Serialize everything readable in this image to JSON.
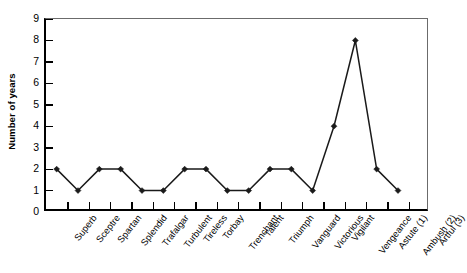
{
  "chart_data": {
    "type": "line",
    "title": "",
    "xlabel": "",
    "ylabel": "Number of years",
    "ylim": [
      0,
      9
    ],
    "ytick_step": 1,
    "yticks": [
      0,
      1,
      2,
      3,
      4,
      5,
      6,
      7,
      8,
      9
    ],
    "ytick_labels": [
      "0",
      "1",
      "2",
      "3",
      "4",
      "5",
      "6",
      "7",
      "8",
      "9"
    ],
    "grid": false,
    "legend": null,
    "marker": "diamond",
    "line_color": "#1a1a1a",
    "categories": [
      "Superb",
      "Sceptre",
      "Spartan",
      "Splendid",
      "Trafalgar",
      "Turbulent",
      "Tireless",
      "Torbay",
      "Trenchant",
      "Talent",
      "Triumph",
      "Vanguard",
      "Victorious",
      "Vigilant",
      "Vengeance",
      "Astute (1)",
      "Ambush (2)",
      "Artful (3)"
    ],
    "values": [
      2,
      1,
      2,
      2,
      1,
      1,
      2,
      2,
      1,
      1,
      2,
      2,
      1,
      4,
      8,
      2,
      1,
      null
    ],
    "series": [
      {
        "name": "Number of years",
        "points": [
          {
            "category": "Superb",
            "value": 2
          },
          {
            "category": "Sceptre",
            "value": 1
          },
          {
            "category": "Spartan",
            "value": 2
          },
          {
            "category": "Splendid",
            "value": 2
          },
          {
            "category": "Trafalgar",
            "value": 1
          },
          {
            "category": "Turbulent",
            "value": 1
          },
          {
            "category": "Tireless",
            "value": 2
          },
          {
            "category": "Torbay",
            "value": 2
          },
          {
            "category": "Trenchant",
            "value": 1
          },
          {
            "category": "Talent",
            "value": 1
          },
          {
            "category": "Triumph",
            "value": 2
          },
          {
            "category": "Vanguard",
            "value": 2
          },
          {
            "category": "Victorious",
            "value": 1
          },
          {
            "category": "Vigilant",
            "value": 4
          },
          {
            "category": "Vengeance",
            "value": 8
          },
          {
            "category": "Astute (1)",
            "value": 2
          },
          {
            "category": "Ambush (2)",
            "value": 1
          }
        ]
      }
    ]
  }
}
